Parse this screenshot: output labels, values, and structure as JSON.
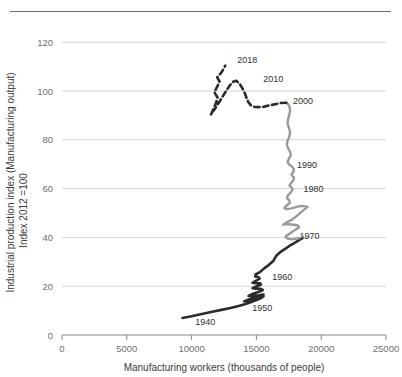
{
  "chart_data": {
    "type": "line",
    "title": "",
    "subtitle": "",
    "xlabel": "Manufacturing workers (thousands of people)",
    "ylabel": "Industrial production index  (Manufacturing output)",
    "ylabel_line2": "Index 2012 =100",
    "xlim": [
      0,
      25000
    ],
    "ylim": [
      0,
      125
    ],
    "xticks": [
      0,
      5000,
      10000,
      15000,
      20000,
      25000
    ],
    "xtick_labels": [
      "0",
      "5000",
      "10000",
      "15000",
      "20000",
      "25000"
    ],
    "yticks": [
      0,
      20,
      40,
      60,
      80,
      100,
      120
    ],
    "ytick_labels": [
      "0",
      "20",
      "40",
      "60",
      "80",
      "100",
      "120"
    ],
    "grid": "horizontal",
    "legend": "none",
    "annotations": [
      {
        "text": "1940",
        "x": 11050,
        "y": 4.0
      },
      {
        "text": "1950",
        "x": 15450,
        "y": 10.0
      },
      {
        "text": "1960",
        "x": 17000,
        "y": 22.5
      },
      {
        "text": "1970",
        "x": 19100,
        "y": 39.5
      },
      {
        "text": "1980",
        "x": 19400,
        "y": 58.5
      },
      {
        "text": "1990",
        "x": 18900,
        "y": 68.5
      },
      {
        "text": "2000",
        "x": 18600,
        "y": 94.5
      },
      {
        "text": "2010",
        "x": 16300,
        "y": 103.5
      },
      {
        "text": "2018",
        "x": 14300,
        "y": 111.5
      }
    ],
    "series": [
      {
        "name": "1940-1970",
        "style": "solid",
        "color": "#2b2b2b",
        "width": 2.6,
        "points": [
          [
            9300,
            7.0
          ],
          [
            9900,
            7.6
          ],
          [
            10700,
            8.5
          ],
          [
            11500,
            9.4
          ],
          [
            12300,
            10.3
          ],
          [
            13000,
            11.1
          ],
          [
            13700,
            12.0
          ],
          [
            14100,
            12.6
          ],
          [
            14450,
            13.2
          ],
          [
            14750,
            13.8
          ],
          [
            15050,
            14.4
          ],
          [
            15350,
            15.1
          ],
          [
            15550,
            15.9
          ],
          [
            15400,
            15.5
          ],
          [
            15000,
            14.8
          ],
          [
            14600,
            14.3
          ],
          [
            14300,
            14.0
          ],
          [
            14050,
            13.8
          ],
          [
            14400,
            14.6
          ],
          [
            14900,
            15.4
          ],
          [
            15350,
            16.1
          ],
          [
            15550,
            16.6
          ],
          [
            15200,
            16.3
          ],
          [
            14750,
            16.0
          ],
          [
            14400,
            16.0
          ],
          [
            14700,
            16.8
          ],
          [
            15150,
            17.6
          ],
          [
            15500,
            18.4
          ],
          [
            15350,
            18.9
          ],
          [
            14950,
            19.0
          ],
          [
            14700,
            19.2
          ],
          [
            15000,
            19.9
          ],
          [
            15350,
            20.7
          ],
          [
            15300,
            21.2
          ],
          [
            14950,
            21.2
          ],
          [
            14700,
            21.4
          ],
          [
            14950,
            22.2
          ],
          [
            15250,
            23.1
          ],
          [
            15150,
            23.8
          ],
          [
            14900,
            24.0
          ],
          [
            14950,
            24.8
          ],
          [
            15300,
            25.9
          ],
          [
            15600,
            27.3
          ],
          [
            15950,
            28.7
          ],
          [
            16300,
            30.3
          ],
          [
            16400,
            31.3
          ],
          [
            16550,
            32.6
          ],
          [
            16900,
            34.2
          ],
          [
            17300,
            35.6
          ],
          [
            17600,
            36.7
          ],
          [
            17900,
            37.6
          ],
          [
            18200,
            38.6
          ],
          [
            18450,
            39.4
          ],
          [
            18600,
            39.9
          ]
        ]
      },
      {
        "name": "1970-2000",
        "style": "solid",
        "color": "#9a9a9a",
        "width": 2.4,
        "points": [
          [
            18600,
            39.9
          ],
          [
            18200,
            39.6
          ],
          [
            17750,
            39.2
          ],
          [
            17350,
            39.6
          ],
          [
            17250,
            40.4
          ],
          [
            17550,
            41.5
          ],
          [
            17950,
            42.9
          ],
          [
            18300,
            44.2
          ],
          [
            18150,
            45.0
          ],
          [
            17700,
            45.3
          ],
          [
            17250,
            45.5
          ],
          [
            17050,
            45.2
          ],
          [
            17350,
            46.2
          ],
          [
            17750,
            47.3
          ],
          [
            18050,
            48.5
          ],
          [
            18300,
            49.6
          ],
          [
            18500,
            50.6
          ],
          [
            18700,
            51.5
          ],
          [
            18950,
            52.5
          ],
          [
            18550,
            52.9
          ],
          [
            18100,
            52.5
          ],
          [
            17700,
            51.9
          ],
          [
            17350,
            51.6
          ],
          [
            17150,
            52.0
          ],
          [
            17350,
            53.1
          ],
          [
            17600,
            54.3
          ],
          [
            17500,
            55.4
          ],
          [
            17350,
            56.2
          ],
          [
            17450,
            57.4
          ],
          [
            17700,
            58.7
          ],
          [
            17800,
            59.8
          ],
          [
            17700,
            60.6
          ],
          [
            17550,
            61.2
          ],
          [
            17650,
            62.1
          ],
          [
            17850,
            63.4
          ],
          [
            17900,
            64.6
          ],
          [
            17750,
            65.3
          ],
          [
            17700,
            65.8
          ],
          [
            17850,
            66.8
          ],
          [
            17900,
            68.0
          ],
          [
            17750,
            69.0
          ],
          [
            17550,
            69.8
          ],
          [
            17400,
            70.8
          ],
          [
            17500,
            72.2
          ],
          [
            17650,
            73.7
          ],
          [
            17600,
            75.2
          ],
          [
            17450,
            76.5
          ],
          [
            17350,
            78.0
          ],
          [
            17400,
            79.6
          ],
          [
            17550,
            81.4
          ],
          [
            17600,
            83.2
          ],
          [
            17500,
            85.0
          ],
          [
            17400,
            86.8
          ],
          [
            17450,
            88.6
          ],
          [
            17550,
            90.4
          ],
          [
            17600,
            92.2
          ],
          [
            17550,
            93.6
          ],
          [
            17450,
            94.6
          ],
          [
            17300,
            95.2
          ]
        ]
      },
      {
        "name": "2000-2018",
        "style": "dashed",
        "color": "#2b2b2b",
        "width": 2.6,
        "points": [
          [
            17300,
            95.2
          ],
          [
            16900,
            95.1
          ],
          [
            16450,
            94.6
          ],
          [
            16000,
            94.1
          ],
          [
            15600,
            93.6
          ],
          [
            15200,
            93.4
          ],
          [
            14850,
            93.5
          ],
          [
            14600,
            94.0
          ],
          [
            14400,
            95.2
          ],
          [
            14250,
            97.0
          ],
          [
            14100,
            99.2
          ],
          [
            13900,
            101.3
          ],
          [
            13700,
            103.0
          ],
          [
            13450,
            104.2
          ],
          [
            13200,
            103.8
          ],
          [
            12950,
            102.3
          ],
          [
            12700,
            100.3
          ],
          [
            12450,
            98.2
          ],
          [
            12200,
            96.0
          ],
          [
            11950,
            94.0
          ],
          [
            11750,
            92.3
          ],
          [
            11550,
            91.0
          ],
          [
            11500,
            90.4
          ],
          [
            11600,
            91.6
          ],
          [
            11750,
            93.4
          ],
          [
            11900,
            95.4
          ],
          [
            12000,
            97.4
          ],
          [
            11850,
            98.6
          ],
          [
            11750,
            99.6
          ],
          [
            11900,
            101.0
          ],
          [
            12050,
            102.6
          ],
          [
            12150,
            104.0
          ],
          [
            12050,
            104.9
          ],
          [
            11980,
            105.6
          ],
          [
            12150,
            106.6
          ],
          [
            12350,
            108.0
          ],
          [
            12500,
            109.4
          ],
          [
            12600,
            110.4
          ]
        ]
      }
    ]
  }
}
